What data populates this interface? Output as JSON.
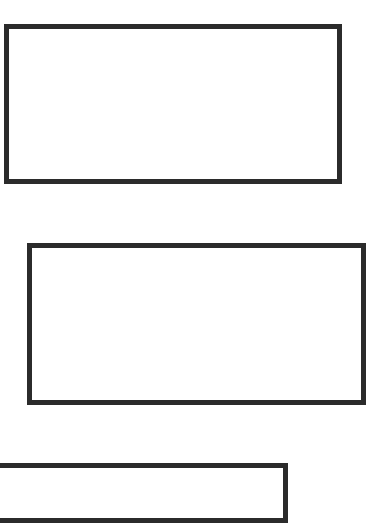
{
  "canvas": {
    "width": 388,
    "height": 486,
    "background": "#ffffff"
  },
  "stroke": {
    "color": "#2b2b2b",
    "width": 5
  },
  "rectangles": [
    {
      "id": "box-1",
      "left": 4,
      "top": 24,
      "width": 338,
      "height": 160
    },
    {
      "id": "box-2",
      "left": 27,
      "top": 243,
      "width": 339,
      "height": 162
    },
    {
      "id": "box-3",
      "left": -10,
      "top": 463,
      "width": 298,
      "height": 60
    }
  ]
}
